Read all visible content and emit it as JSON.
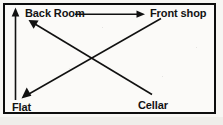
{
  "diagram": {
    "type": "flow-diagram",
    "border_color": "#0d0d0d",
    "line_color": "#111111",
    "background_color": "#fbfaf8",
    "nodes": [
      {
        "id": "back-room",
        "label": "Back Room",
        "position": "top-left"
      },
      {
        "id": "front-shop",
        "label": "Front shop",
        "position": "top-right"
      },
      {
        "id": "flat",
        "label": "Flat",
        "position": "bottom-left"
      },
      {
        "id": "cellar",
        "label": "Cellar",
        "position": "bottom-right"
      }
    ],
    "arrows": [
      {
        "id": "arrow-back-room-to-front-shop",
        "from": "back-room",
        "to": "front-shop",
        "direction": "horizontal-right"
      },
      {
        "id": "arrow-flat-to-back-room",
        "from": "flat",
        "to": "back-room",
        "direction": "vertical-up"
      },
      {
        "id": "arrow-cellar-to-back-room",
        "from": "cellar",
        "to": "back-room",
        "direction": "diagonal-up-left"
      },
      {
        "id": "arrow-front-shop-to-flat",
        "from": "front-shop",
        "to": "flat",
        "direction": "diagonal-down-left"
      }
    ]
  }
}
